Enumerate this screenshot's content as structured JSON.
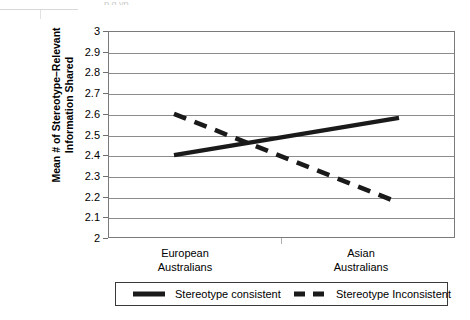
{
  "chart_data": {
    "type": "line",
    "title": "",
    "xlabel": "",
    "ylabel": "Mean # of Stereotype–Relevant Information Shared",
    "categories": [
      "European Australians",
      "Asian Australians"
    ],
    "category_lines": [
      [
        "European",
        "Australians"
      ],
      [
        "Asian",
        "Australians"
      ]
    ],
    "ylim": [
      2,
      3
    ],
    "yticks": [
      "3",
      "2.9",
      "2.8",
      "2.7",
      "2.6",
      "2.5",
      "2.4",
      "2.3",
      "2.2",
      "2.1",
      "2"
    ],
    "ytick_values": [
      3,
      2.9,
      2.8,
      2.7,
      2.6,
      2.5,
      2.4,
      2.3,
      2.2,
      2.1,
      2
    ],
    "grid": true,
    "legend_position": "bottom",
    "series": [
      {
        "name": "Stereotype consistent",
        "style": "solid",
        "color": "#1a1a1a",
        "values": [
          2.4,
          2.58
        ]
      },
      {
        "name": "Stereotype Inconsistent",
        "style": "dashed",
        "color": "#1a1a1a",
        "values": [
          2.6,
          2.17
        ]
      }
    ]
  },
  "axis": {
    "y_title": "Mean # of Stereotype–Relevant Information Shared",
    "y_title_line_1": "Mean # of Stereotype–Relevant",
    "y_title_line_2": "Information Shared",
    "ticks": [
      "3",
      "2.9",
      "2.8",
      "2.7",
      "2.6",
      "2.5",
      "2.4",
      "2.3",
      "2.2",
      "2.1",
      "2"
    ],
    "x_labels": [
      {
        "line1": "European",
        "line2": "Australians"
      },
      {
        "line1": "Asian",
        "line2": "Australians"
      }
    ]
  },
  "legend": {
    "items": [
      {
        "label": "Stereotype consistent",
        "style": "solid"
      },
      {
        "label": "Stereotype Inconsistent",
        "style": "dashed"
      }
    ]
  },
  "artifacts": {
    "cropped_title_fragment": "p g yp"
  },
  "colors": {
    "line": "#1a1a1a",
    "grid": "#8c8c8c",
    "frame": "#7a7a7a",
    "background": "#ffffff"
  }
}
